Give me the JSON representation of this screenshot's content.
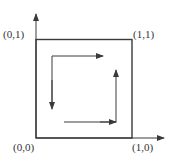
{
  "diagram": {
    "labels": {
      "origin": "(0,0)",
      "top_left": "(0,1)",
      "top_right": "(1,1)",
      "bottom_right": "(1,0)"
    },
    "colors": {
      "stroke": "#3a3a3a",
      "text": "#333333"
    }
  }
}
